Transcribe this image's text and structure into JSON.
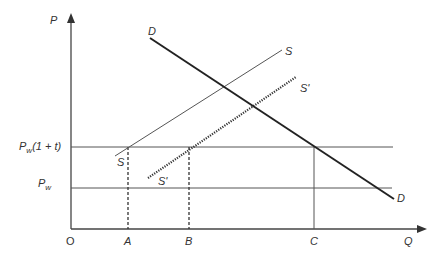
{
  "diagram": {
    "title": "",
    "axes": {
      "y_label": "P",
      "x_label": "Q",
      "origin_label": "O"
    },
    "price_levels": [
      {
        "id": "pw_tariff",
        "label_main": "P",
        "label_sub": "w",
        "label_suffix": "(1 + t)"
      },
      {
        "id": "pw",
        "label_main": "P",
        "label_sub": "w"
      }
    ],
    "quantity_marks": [
      {
        "id": "A",
        "label": "A"
      },
      {
        "id": "B",
        "label": "B"
      },
      {
        "id": "C",
        "label": "C"
      }
    ],
    "curves": {
      "demand": {
        "start_label": "D",
        "end_label": "D"
      },
      "supply": {
        "start_label": "S",
        "end_label": "S"
      },
      "supply_shifted": {
        "start_label": "S'",
        "end_label": "S'"
      }
    },
    "colors": {
      "line": "#444444",
      "demand": "#222222",
      "text": "#333333"
    }
  }
}
